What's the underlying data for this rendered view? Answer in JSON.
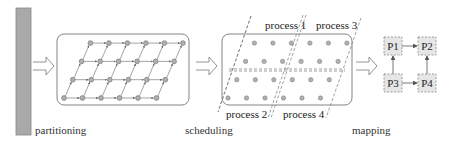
{
  "stages": [
    {
      "id": "partitioning",
      "label": "partitioning"
    },
    {
      "id": "scheduling",
      "label": "scheduling"
    },
    {
      "id": "mapping",
      "label": "mapping"
    }
  ],
  "partitioning": {
    "grid_rows": 4,
    "grid_cols": 6,
    "node_color": "#aaaaaa",
    "edge_color": "#666666"
  },
  "scheduling": {
    "processes": [
      {
        "id": "process1",
        "label": "process 1"
      },
      {
        "id": "process2",
        "label": "process 2"
      },
      {
        "id": "process3",
        "label": "process 3"
      },
      {
        "id": "process4",
        "label": "process 4"
      }
    ]
  },
  "mapping": {
    "nodes": [
      {
        "id": "P1",
        "label": "P1"
      },
      {
        "id": "P2",
        "label": "P2"
      },
      {
        "id": "P3",
        "label": "P3"
      },
      {
        "id": "P4",
        "label": "P4"
      }
    ],
    "edges": [
      {
        "from": "P1",
        "to": "P2"
      },
      {
        "from": "P3",
        "to": "P1"
      },
      {
        "from": "P3",
        "to": "P4"
      },
      {
        "from": "P4",
        "to": "P2"
      }
    ]
  },
  "colors": {
    "bar_fill": "#a9a9a9",
    "box_stroke": "#777777",
    "node_fill": "#b0b0b0",
    "p_box_fill": "#e6e6e6"
  }
}
